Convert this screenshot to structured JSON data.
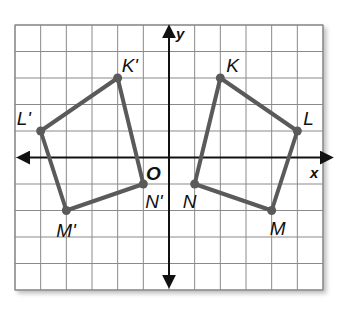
{
  "diagram": {
    "grid": {
      "x_min": -6,
      "x_max": 6,
      "y_min": -5,
      "y_max": 5,
      "step": 1
    },
    "axes": {
      "x_label": "x",
      "y_label": "y",
      "origin_label": "O"
    },
    "colors": {
      "polygon": "#5a5a5a",
      "grid": "#8a8a8a",
      "axis": "#111111"
    },
    "shapes": [
      {
        "name": "KLMN",
        "points": [
          {
            "label": "K",
            "x": 2,
            "y": 3
          },
          {
            "label": "L",
            "x": 5,
            "y": 1
          },
          {
            "label": "M",
            "x": 4,
            "y": -2
          },
          {
            "label": "N",
            "x": 1,
            "y": -1
          }
        ]
      },
      {
        "name": "K'L'M'N'",
        "points": [
          {
            "label": "K'",
            "x": -2,
            "y": 3
          },
          {
            "label": "L'",
            "x": -5,
            "y": 1
          },
          {
            "label": "M'",
            "x": -4,
            "y": -2
          },
          {
            "label": "N'",
            "x": -1,
            "y": -1
          }
        ]
      }
    ]
  }
}
